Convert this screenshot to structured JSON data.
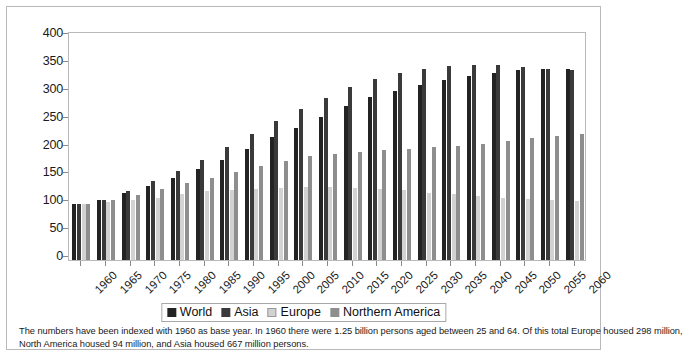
{
  "chart_data": {
    "type": "bar",
    "title": "",
    "subtitle": "",
    "xlabel": "",
    "ylabel": "",
    "ylim": [
      0,
      400
    ],
    "yticks": [
      0,
      50,
      100,
      150,
      200,
      250,
      300,
      350,
      400
    ],
    "grid": false,
    "legend_position": "bottom",
    "categories": [
      "1960",
      "1965",
      "1970",
      "1975",
      "1980",
      "1985",
      "1990",
      "1995",
      "2000",
      "2005",
      "2010",
      "2015",
      "2020",
      "2025",
      "2030",
      "2035",
      "2040",
      "2045",
      "2050",
      "2055",
      "2060"
    ],
    "series": [
      {
        "name": "World",
        "color": "#232323",
        "values": [
          100,
          107,
          120,
          133,
          148,
          163,
          180,
          199,
          220,
          237,
          257,
          276,
          292,
          304,
          314,
          323,
          330,
          336,
          340,
          342,
          343
        ]
      },
      {
        "name": "Asia",
        "color": "#3a3a3a",
        "values": [
          100,
          108,
          124,
          141,
          159,
          179,
          203,
          226,
          250,
          271,
          291,
          310,
          325,
          336,
          343,
          348,
          350,
          350,
          347,
          343,
          340
        ]
      },
      {
        "name": "Europe",
        "color": "#d2d2d2",
        "values": [
          100,
          104,
          107,
          112,
          119,
          123,
          126,
          128,
          130,
          131,
          131,
          130,
          128,
          125,
          121,
          118,
          115,
          112,
          109,
          107,
          105
        ]
      },
      {
        "name": "Northern America",
        "color": "#8e8e8e",
        "values": [
          100,
          107,
          116,
          128,
          138,
          147,
          157,
          168,
          178,
          186,
          191,
          194,
          197,
          199,
          202,
          205,
          208,
          213,
          218,
          222,
          226
        ]
      }
    ],
    "annotations": [
      "The numbers have been indexed with 1960 as base year. In 1960 there were 1.25 billion persons aged between 25 and 64. Of this total Europe housed 298 million,",
      "North America housed 94 million, and Asia housed 667 million persons."
    ]
  },
  "legend": {
    "items": [
      {
        "label": "World"
      },
      {
        "label": "Asia"
      },
      {
        "label": "Europe"
      },
      {
        "label": "Northern America"
      }
    ]
  },
  "footnote": {
    "line1": "The numbers have been indexed with 1960 as base year. In 1960 there were 1.25 billion persons aged between 25 and 64. Of this total Europe housed 298 million,",
    "line2": "North America housed 94 million, and Asia housed 667 million persons."
  }
}
